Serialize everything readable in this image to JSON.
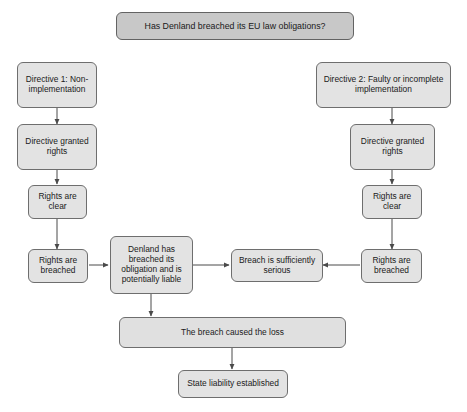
{
  "diagram": {
    "title_box": {
      "label": "Has Denland breached its EU law obligations?"
    },
    "branches": {
      "left": {
        "start": {
          "label": "Directive 1: Non-implementation"
        },
        "granted": {
          "label": "Directive granted rights"
        },
        "clear": {
          "label": "Rights are clear"
        },
        "breached": {
          "label": "Rights are breached"
        }
      },
      "right": {
        "start": {
          "label": "Directive 2: Faulty or incomplete implementation"
        },
        "granted": {
          "label": "Directive granted rights"
        },
        "clear": {
          "label": "Rights are clear"
        },
        "breached": {
          "label": "Rights are breached"
        }
      }
    },
    "center": {
      "liable": {
        "label": "Denland has breached its obligation and is potentially liable"
      },
      "serious": {
        "label": "Breach is sufficiently serious"
      }
    },
    "conclusion": {
      "causation": {
        "label": "The breach caused the loss"
      },
      "result": {
        "label": "State liability established"
      }
    },
    "colors": {
      "box_fill": "#e3e3e3",
      "title_fill": "#c8c8c8",
      "border": "#6e6e6e",
      "arrow": "#4a4a4a",
      "text": "#1a1a1a",
      "background": "#ffffff"
    }
  }
}
